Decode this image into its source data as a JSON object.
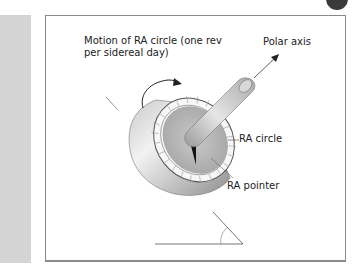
{
  "figure": {
    "labels": {
      "motion_line1": "Motion of RA circle (one rev",
      "motion_line2": "per sidereal day)",
      "polar_axis": "Polar axis",
      "ra_circle": "RA circle",
      "ra_pointer": "RA pointer"
    },
    "colors": {
      "side_strip": "#d4d4d4",
      "frame_border": "#8a8a8a",
      "metal_light": "#e8e8e8",
      "metal_dark": "#8c8c8c",
      "pointer": "#111111"
    }
  }
}
